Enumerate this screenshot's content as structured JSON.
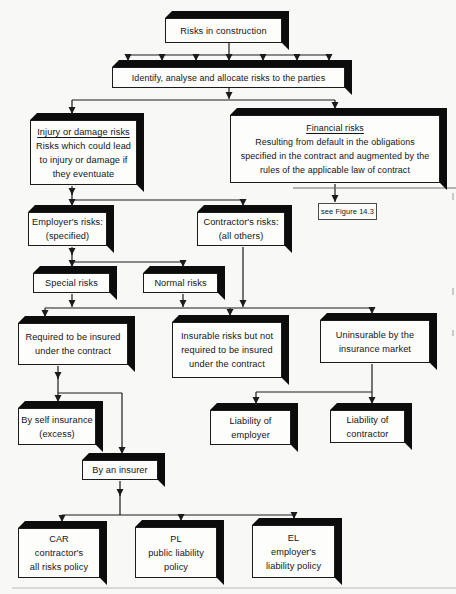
{
  "figure": {
    "kind": "flowchart",
    "colors": {
      "ink": "#1b1b1b",
      "shadow": "#0c0c0c",
      "paper": "#f8f8f6",
      "box_fill": "#fdfdfc"
    },
    "nodes": {
      "risks": {
        "lines": [
          "Risks in construction"
        ]
      },
      "identify": {
        "lines": [
          "Identify, analyse and allocate risks to the parties"
        ]
      },
      "injury": {
        "title": "Injury or damage risks",
        "lines": [
          "Risks which could lead",
          "to injury or damage if",
          "they eventuate"
        ]
      },
      "financial": {
        "title": "Financial risks",
        "lines": [
          "Resulting from default in the obligations",
          "specified in the contract and augmented by the",
          "rules of the applicable law of contract"
        ]
      },
      "see_figure": {
        "lines": [
          "see Figure 14.3"
        ]
      },
      "employers": {
        "lines": [
          "Employer's risks:",
          "(specified)"
        ]
      },
      "contractors": {
        "lines": [
          "Contractor's risks:",
          "(all others)"
        ]
      },
      "special": {
        "lines": [
          "Special risks"
        ]
      },
      "normal": {
        "lines": [
          "Normal risks"
        ]
      },
      "required": {
        "lines": [
          "Required to be insured",
          "under the contract"
        ]
      },
      "insurable": {
        "lines": [
          "Insurable risks but not",
          "required to be insured",
          "under the contract"
        ]
      },
      "uninsurable": {
        "lines": [
          "Uninsurable by the",
          "insurance market"
        ]
      },
      "self_insurance": {
        "lines": [
          "By self insurance",
          "(excess)"
        ]
      },
      "insurer": {
        "lines": [
          "By an insurer"
        ]
      },
      "liability_employer": {
        "lines": [
          "Liability of",
          "employer"
        ]
      },
      "liability_contractor": {
        "lines": [
          "Liability of",
          "contractor"
        ]
      },
      "car": {
        "lines": [
          "CAR",
          "contractor's",
          "all risks policy"
        ]
      },
      "pl": {
        "lines": [
          "PL",
          "public liability",
          "policy"
        ]
      },
      "el": {
        "lines": [
          "EL",
          "employer's",
          "liability policy"
        ]
      }
    }
  }
}
